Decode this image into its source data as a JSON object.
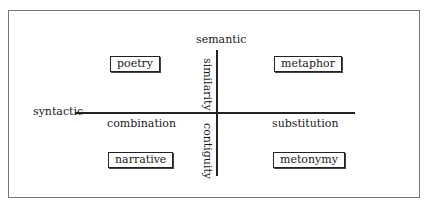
{
  "diagram": {
    "axes": {
      "vertical_top": "semantic",
      "horizontal_left": "syntactic",
      "vertical_upper_label": "similarity",
      "vertical_lower_label": "contiguity",
      "horizontal_left_label": "combination",
      "horizontal_right_label": "substitution"
    },
    "quadrants": {
      "top_left": "poetry",
      "top_right": "metaphor",
      "bottom_left": "narrative",
      "bottom_right": "metonymy"
    }
  }
}
